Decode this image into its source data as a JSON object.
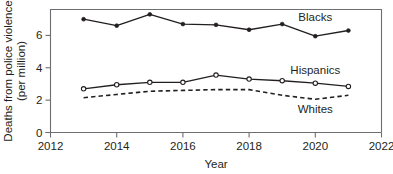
{
  "chart_data": {
    "type": "line",
    "title": "",
    "subtitle": "",
    "xlabel": "Year",
    "ylabel": "Deaths from police violence (per million)",
    "ylabel_line1": "Deaths from police violence",
    "ylabel_line2": "(per million)",
    "x": [
      2013,
      2014,
      2015,
      2016,
      2017,
      2018,
      2019,
      2020,
      2021
    ],
    "xlim": [
      2012,
      2022
    ],
    "ylim": [
      0,
      7.6
    ],
    "xticks": [
      2012,
      2014,
      2016,
      2018,
      2020,
      2022
    ],
    "xtick_labels": [
      "2012",
      "2014",
      "2016",
      "2018",
      "2020",
      "2022"
    ],
    "yticks": [
      0,
      2,
      4,
      6
    ],
    "ytick_labels": [
      "0",
      "2",
      "4",
      "6"
    ],
    "grid": false,
    "legend_position": "inline-right",
    "series": [
      {
        "name": "Blacks",
        "label": "Blacks",
        "marker": "filled-circle",
        "linestyle": "solid",
        "color": "#231f20",
        "values": [
          7.0,
          6.6,
          7.3,
          6.7,
          6.65,
          6.35,
          6.7,
          5.95,
          6.3
        ],
        "label_x": 2020.0,
        "label_y": 7.15
      },
      {
        "name": "Hispanics",
        "label": "Hispanics",
        "marker": "open-circle",
        "linestyle": "solid",
        "color": "#231f20",
        "values": [
          2.7,
          2.95,
          3.1,
          3.1,
          3.55,
          3.3,
          3.2,
          3.05,
          2.85
        ],
        "label_x": 2020.0,
        "label_y": 3.85
      },
      {
        "name": "Whites",
        "label": "Whites",
        "marker": "none",
        "linestyle": "dashed",
        "color": "#231f20",
        "values": [
          2.15,
          2.35,
          2.55,
          2.6,
          2.65,
          2.65,
          2.3,
          2.05,
          2.3
        ],
        "label_x": 2020.0,
        "label_y": 1.45
      }
    ]
  }
}
